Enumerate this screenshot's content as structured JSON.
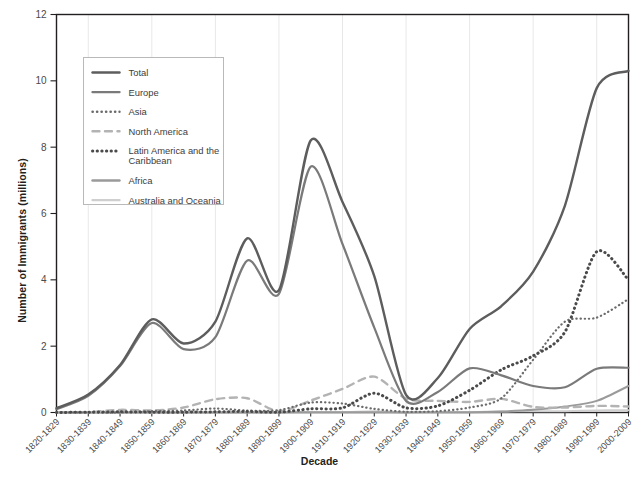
{
  "chart_data": {
    "type": "line",
    "title": "",
    "xlabel": "Decade",
    "ylabel": "Number of Immigrants (millions)",
    "ylim": [
      0,
      12
    ],
    "yticks": [
      0,
      2,
      4,
      6,
      8,
      10,
      12
    ],
    "ytick_labels": [
      "0",
      "2",
      "4",
      "6",
      "8",
      "10",
      "12"
    ],
    "grid": "vertical-only",
    "legend_position": "upper-left-inside",
    "categories": [
      "1820-1829",
      "1830-1839",
      "1840-1849",
      "1850-1859",
      "1860-1869",
      "1870-1879",
      "1880-1889",
      "1890-1899",
      "1900-1909",
      "1910-1919",
      "1920-1929",
      "1930-1939",
      "1940-1949",
      "1950-1959",
      "1960-1969",
      "1970-1979",
      "1980-1989",
      "1990-1999",
      "2000-2009"
    ],
    "series": [
      {
        "name": "Total",
        "color": "#5d5d5d",
        "style": "solid",
        "width": 2.4,
        "values": [
          0.13,
          0.54,
          1.43,
          2.81,
          2.08,
          2.74,
          5.25,
          3.69,
          8.2,
          6.35,
          4.11,
          0.53,
          1.04,
          2.52,
          3.21,
          4.25,
          6.24,
          9.78,
          10.3
        ]
      },
      {
        "name": "Europe",
        "color": "#7a7a7a",
        "style": "solid",
        "width": 2.2,
        "values": [
          0.1,
          0.5,
          1.4,
          2.7,
          1.91,
          2.27,
          4.58,
          3.58,
          7.41,
          5.08,
          2.56,
          0.35,
          0.62,
          1.33,
          1.12,
          0.8,
          0.76,
          1.32,
          1.35
        ]
      },
      {
        "name": "Asia",
        "color": "#6b6b6b",
        "style": "dotted-fine",
        "width": 2.2,
        "values": [
          0.0,
          0.0,
          0.0,
          0.04,
          0.06,
          0.12,
          0.06,
          0.07,
          0.3,
          0.27,
          0.11,
          0.02,
          0.04,
          0.15,
          0.43,
          1.59,
          2.74,
          2.86,
          3.42
        ]
      },
      {
        "name": "North America",
        "color": "#b3b3b3",
        "style": "dashed",
        "width": 2.4,
        "values": [
          0.01,
          0.01,
          0.08,
          0.06,
          0.15,
          0.4,
          0.43,
          0.04,
          0.36,
          0.71,
          1.08,
          0.42,
          0.35,
          0.32,
          0.41,
          0.17,
          0.15,
          0.2,
          0.18
        ]
      },
      {
        "name": "Latin America and the Caribbean",
        "color": "#4a4a4a",
        "style": "dotted-bold",
        "width": 3.0,
        "values": [
          0.0,
          0.01,
          0.02,
          0.01,
          0.01,
          0.02,
          0.03,
          0.01,
          0.11,
          0.14,
          0.58,
          0.14,
          0.2,
          0.67,
          1.29,
          1.71,
          2.43,
          4.85,
          4.0
        ]
      },
      {
        "name": "Africa",
        "color": "#9a9a9a",
        "style": "solid",
        "width": 2.0,
        "values": [
          0.0,
          0.0,
          0.0,
          0.0,
          0.0,
          0.0,
          0.0,
          0.0,
          0.01,
          0.01,
          0.01,
          0.0,
          0.01,
          0.01,
          0.03,
          0.08,
          0.18,
          0.35,
          0.8
        ]
      },
      {
        "name": "Australia and Oceania",
        "color": "#cfcfcf",
        "style": "solid",
        "width": 2.0,
        "values": [
          0.0,
          0.0,
          0.0,
          0.0,
          0.0,
          0.01,
          0.01,
          0.0,
          0.01,
          0.01,
          0.04,
          0.01,
          0.01,
          0.01,
          0.03,
          0.04,
          0.04,
          0.06,
          0.07
        ]
      }
    ],
    "legend_items": [
      {
        "label": "Total",
        "color": "#5d5d5d",
        "style": "solid"
      },
      {
        "label": "Europe",
        "color": "#7a7a7a",
        "style": "solid"
      },
      {
        "label": "Asia",
        "color": "#6b6b6b",
        "style": "dotted-fine"
      },
      {
        "label": "North America",
        "color": "#b3b3b3",
        "style": "dashed"
      },
      {
        "label": "Latin America and the",
        "label2": "Caribbean",
        "color": "#4a4a4a",
        "style": "dotted-bold"
      },
      {
        "label": "Africa",
        "color": "#9a9a9a",
        "style": "solid"
      },
      {
        "label": "Australia and Oceania",
        "color": "#cfcfcf",
        "style": "solid"
      }
    ],
    "colors": {
      "axis": "#231f20",
      "gridline": "#e8e8e8",
      "legend_border": "#b9b9b9",
      "tick_text": "#4a4a4a",
      "axis_title": "#231f20"
    }
  }
}
